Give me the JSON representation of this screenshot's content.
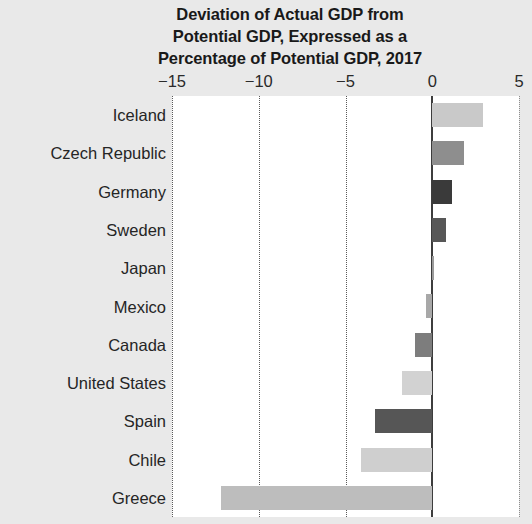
{
  "chart_data": {
    "type": "bar",
    "orientation": "horizontal",
    "title": "Deviation of Actual GDP from\nPotential GDP, Expressed as a\nPercentage of Potential GDP, 2017",
    "xlabel": "",
    "ylabel": "",
    "xlim": [
      -15,
      5
    ],
    "xticks": [
      -15,
      -10,
      -5,
      0,
      5
    ],
    "xticklabels": [
      "−15",
      "−10",
      "−5",
      "0",
      "5"
    ],
    "grid": "vertical-dotted",
    "legend": "none",
    "zero_line": true,
    "categories": [
      "Iceland",
      "Czech Republic",
      "Germany",
      "Sweden",
      "Japan",
      "Mexico",
      "Canada",
      "United States",
      "Spain",
      "Chile",
      "Greece"
    ],
    "values": [
      2.9,
      1.85,
      1.15,
      0.8,
      0.0,
      -0.35,
      -1.0,
      -1.75,
      -3.3,
      -4.1,
      -12.2
    ],
    "bar_colors": [
      "#c9c9c9",
      "#8e8e8e",
      "#3a3a3a",
      "#575757",
      "#9a9a9a",
      "#a8a8a8",
      "#7d7d7d",
      "#d2d2d2",
      "#565656",
      "#cfcfcf",
      "#bdbdbd"
    ]
  },
  "colors": {
    "page_background": "#e9e9e9",
    "plot_background": "#ffffff",
    "gridline": "#5a5a5a",
    "zero_line": "#3d3d3d",
    "title_text": "#191919",
    "label_text": "#252525"
  }
}
